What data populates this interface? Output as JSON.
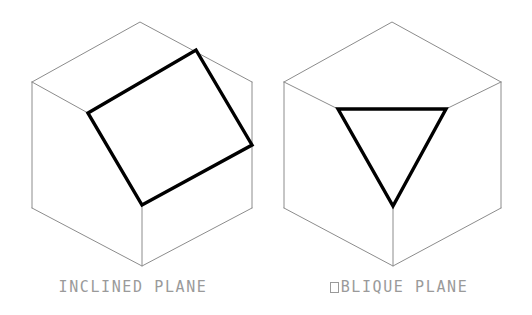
{
  "document": {
    "title": "Inclined and Oblique Planes",
    "background_color": "#ffffff",
    "width": 532,
    "height": 315
  },
  "style": {
    "cube_edge_color": "#8c8c8c",
    "plane_outline_color": "#000000",
    "caption_color": "#9a9a9a",
    "cube_edge_width": 1,
    "plane_outline_width": 3.4
  },
  "figures": [
    {
      "id": "inclined-plane",
      "caption": "INCLINED PLANE",
      "caption_prefix_glyph": "",
      "type": "isometric-cube-with-highlighted-face",
      "highlighted_face": "inclined plane (quadrilateral)",
      "geometry": {
        "cube_top_apex": [
          140,
          22
        ],
        "cube_left_top": [
          32,
          82
        ],
        "cube_right_top": [
          252,
          82
        ],
        "cube_left_bottom": [
          32,
          208
        ],
        "cube_right_bottom": [
          252,
          208
        ],
        "cube_front_bottom": [
          142,
          266
        ],
        "cube_front_mid": [
          142,
          205
        ],
        "plane_corners": [
          [
            88,
            113
          ],
          [
            196,
            50
          ],
          [
            252,
            145
          ],
          [
            142,
            205
          ]
        ]
      }
    },
    {
      "id": "oblique-plane",
      "caption": "OBLIQUE PLANE",
      "caption_prefix_glyph": "tofu-box",
      "type": "isometric-cube-with-highlighted-face",
      "highlighted_face": "oblique plane (triangle)",
      "geometry": {
        "cube_top_apex": [
          392,
          22
        ],
        "cube_left_top": [
          284,
          82
        ],
        "cube_right_top": [
          501,
          82
        ],
        "cube_left_bottom": [
          284,
          208
        ],
        "cube_right_bottom": [
          501,
          208
        ],
        "cube_front_bottom": [
          393,
          266
        ],
        "plane_corners": [
          [
            338,
            109
          ],
          [
            446,
            109
          ],
          [
            393,
            206
          ]
        ]
      }
    }
  ]
}
